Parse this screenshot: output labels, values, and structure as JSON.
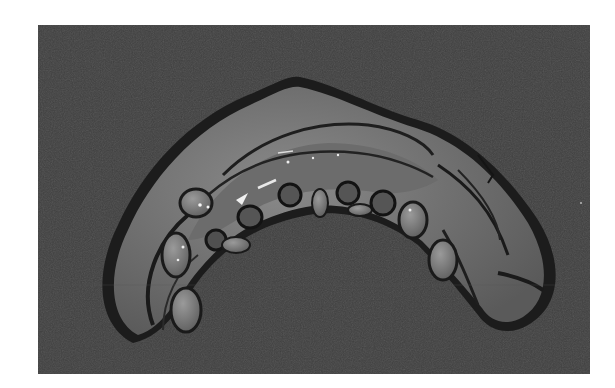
{
  "figure": {
    "rendering": "grayscale",
    "colors": {
      "page_background": "#ffffff",
      "scene_background": "#3f3f3f",
      "model_base": "#808080",
      "model_shadow": "#1a1a1a",
      "highlight": "#f0f0f0"
    }
  }
}
